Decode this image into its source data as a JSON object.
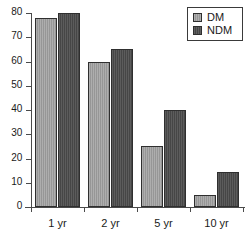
{
  "chart_data": {
    "type": "bar",
    "title": "",
    "subtitle": "",
    "xlabel": "",
    "ylabel": "",
    "categories": [
      "1 yr",
      "2 yr",
      "5 yr",
      "10 yr"
    ],
    "series": [
      {
        "name": "DM",
        "color": "#9e9e9e",
        "values": [
          78,
          60,
          25,
          5
        ]
      },
      {
        "name": "NDM",
        "color": "#4a4a4a",
        "values": [
          80,
          65,
          40,
          14.5
        ]
      }
    ],
    "ylim": [
      0,
      80
    ],
    "ytick_values": [
      0,
      10,
      20,
      30,
      40,
      50,
      60,
      70,
      80
    ],
    "ytick_labels": [
      "0",
      "10",
      "20",
      "30",
      "40",
      "50",
      "60",
      "70",
      "80"
    ],
    "grid": false,
    "legend_position": "top-right",
    "legend_entries": [
      "DM",
      "NDM"
    ],
    "annotations": []
  },
  "axis": {
    "axis_color": "#4a4a4a",
    "bar_border_color": "#2f2f2f",
    "background": "#ffffff"
  }
}
